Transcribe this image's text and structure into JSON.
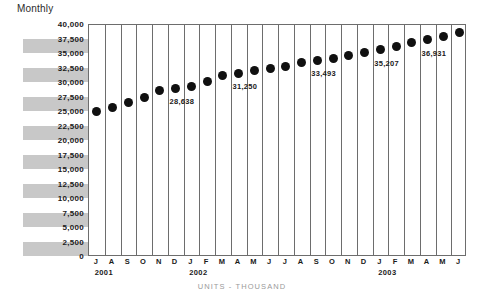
{
  "chart_data": {
    "type": "scatter",
    "title": "Monthly",
    "xlabel": "",
    "ylabel": "",
    "caption": "UNITS - THOUSAND",
    "ylim": [
      0,
      40000
    ],
    "grid": true,
    "legend": false,
    "yticks": [
      "0",
      "2,500",
      "5,000",
      "7,500",
      "10,000",
      "12,500",
      "15,000",
      "17,500",
      "20,000",
      "22,500",
      "25,000",
      "27,500",
      "30,000",
      "32,500",
      "35,000",
      "37,500",
      "40,000"
    ],
    "ytick_values": [
      0,
      2500,
      5000,
      7500,
      10000,
      12500,
      15000,
      17500,
      20000,
      22500,
      25000,
      27500,
      30000,
      32500,
      35000,
      37500,
      40000
    ],
    "categories": [
      "J",
      "A",
      "S",
      "O",
      "N",
      "D",
      "J",
      "F",
      "M",
      "A",
      "M",
      "J",
      "J",
      "A",
      "S",
      "O",
      "N",
      "D",
      "J",
      "F",
      "M",
      "A",
      "M",
      "J"
    ],
    "year_groups": [
      {
        "label": "2001",
        "start_index": 0,
        "span": 6
      },
      {
        "label": "2002",
        "start_index": 6,
        "span": 12
      },
      {
        "label": "2003",
        "start_index": 18,
        "span": 6
      }
    ],
    "values": [
      25100,
      25800,
      26700,
      27500,
      28638,
      29100,
      29400,
      30300,
      31250,
      31700,
      32200,
      32500,
      32900,
      33493,
      33800,
      34300,
      34700,
      35207,
      35800,
      36300,
      36931,
      37500,
      38000,
      38648
    ],
    "point_labels": [
      {
        "index": 4,
        "text": "28,638"
      },
      {
        "index": 8,
        "text": "31,250"
      },
      {
        "index": 13,
        "text": "33,493"
      },
      {
        "index": 17,
        "text": "35,207"
      },
      {
        "index": 20,
        "text": "36,931"
      },
      {
        "index": 23,
        "text": "38,648"
      }
    ],
    "colors": {
      "marker": "#101010",
      "band": "#c8c8c8",
      "gridline": "#6d6d6d",
      "plot_background": "#ffffff",
      "text": "#1a1a1a",
      "caption": "#9a9a9a"
    }
  }
}
